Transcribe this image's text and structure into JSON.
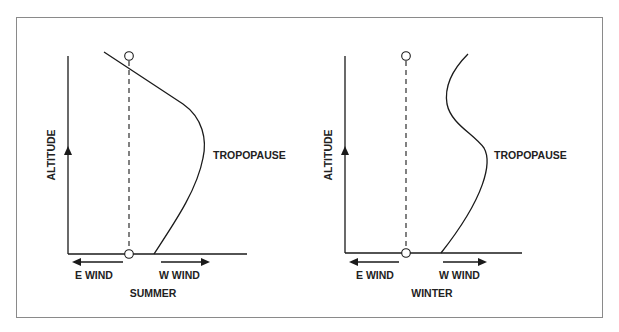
{
  "figure": {
    "panels": [
      {
        "id": "summer",
        "caption": "SUMMER",
        "y_axis_label": "ALTITUDE",
        "curve_label": "TROPOPAUSE",
        "left_arrow_label": "E WIND",
        "right_arrow_label": "W WIND"
      },
      {
        "id": "winter",
        "caption": "WINTER",
        "y_axis_label": "ALTITUDE",
        "curve_label": "TROPOPAUSE",
        "left_arrow_label": "E WIND",
        "right_arrow_label": "W WIND"
      }
    ],
    "colors": {
      "line": "#1a1a1a",
      "frame": "#8a8a8a",
      "background": "#ffffff"
    }
  }
}
